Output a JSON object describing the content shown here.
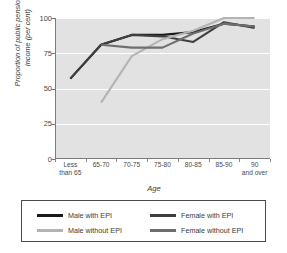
{
  "chart_data": {
    "type": "line",
    "title": "",
    "xlabel": "Age",
    "ylabel": "Proportion of public pension in income (per cent)",
    "categories": [
      "Less than 65",
      "65-70",
      "70-75",
      "75-80",
      "80-85",
      "85-90",
      "90 and over"
    ],
    "category_lines": [
      [
        "Less",
        "than 65"
      ],
      [
        "65-70",
        ""
      ],
      [
        "70-75",
        ""
      ],
      [
        "75-80",
        ""
      ],
      [
        "80-85",
        ""
      ],
      [
        "85-90",
        ""
      ],
      [
        "90",
        "and over"
      ]
    ],
    "ylim": [
      0,
      100
    ],
    "yticks": [
      0,
      25,
      50,
      75,
      100
    ],
    "grid": true,
    "grid_color": "#ffffff",
    "plot_background": "#e2e2e2",
    "legend_position": "below",
    "series": [
      {
        "name": "Male with EPI",
        "color": "#1a1a1a",
        "values": [
          57,
          81,
          88,
          88,
          90,
          96,
          94
        ]
      },
      {
        "name": "Female with EPI",
        "color": "#3f3f3f",
        "values": [
          57,
          81,
          88,
          87,
          83,
          97,
          93
        ]
      },
      {
        "name": "Male without EPI",
        "color": "#b4b4b4",
        "values": [
          null,
          40,
          73,
          85,
          91,
          100,
          100
        ]
      },
      {
        "name": "Female without EPI",
        "color": "#6e6e6e",
        "values": [
          null,
          81,
          79,
          79,
          89,
          96,
          94
        ]
      }
    ]
  },
  "legend": {
    "entries": [
      {
        "label": "Male with EPI",
        "color": "#1a1a1a"
      },
      {
        "label": "Female with EPI",
        "color": "#3f3f3f"
      },
      {
        "label": "Male without EPI",
        "color": "#b4b4b4"
      },
      {
        "label": "Female without EPI",
        "color": "#6e6e6e"
      }
    ]
  }
}
